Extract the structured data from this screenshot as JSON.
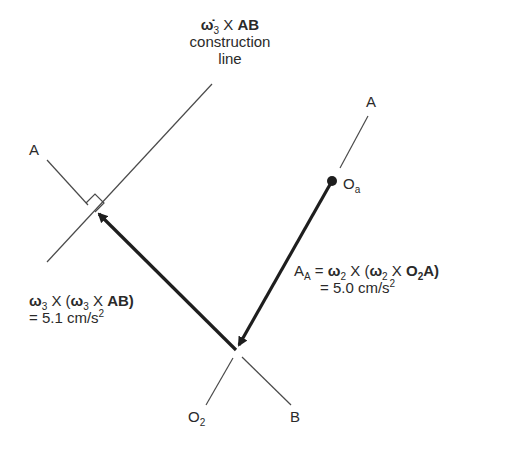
{
  "labels": {
    "construction": {
      "symbol": "ω̇",
      "sub": "3",
      "cross": "X",
      "vec": "AB",
      "line2": "construction",
      "line3": "line"
    },
    "point_a_left": "A",
    "point_a_right": "A",
    "point_oa": {
      "main": "O",
      "sub": "a"
    },
    "point_o2": {
      "main": "O",
      "sub": "2"
    },
    "point_b": "B",
    "accel_a": {
      "lhs_main": "A",
      "lhs_sub": "A",
      "eq": "=",
      "w2a": "ω",
      "w2a_sub": "2",
      "cross1": "X",
      "paren_open": "(",
      "w2b": "ω",
      "w2b_sub": "2",
      "cross2": "X",
      "o2": "O",
      "o2_sub": "2",
      "a_end": "A)",
      "value": "= 5.0 cm/s",
      "value_sup": "2"
    },
    "accel_ab": {
      "w3a": "ω",
      "w3a_sub": "3",
      "cross1": "X",
      "paren_open": "(",
      "w3b": "ω",
      "w3b_sub": "3",
      "cross2": "X",
      "ab": "AB)",
      "value": "= 5.1 cm/s",
      "value_sup": "2"
    }
  },
  "colors": {
    "ink": "#2a2a2a",
    "thin_line": "#4a4a4a",
    "background": "#ffffff"
  },
  "geometry": {
    "construction_line": [
      [
        212,
        84
      ],
      [
        47,
        262
      ]
    ],
    "ab_line_segment": [
      [
        47,
        160
      ],
      [
        88,
        205
      ]
    ],
    "arrow_ab": [
      [
        236,
        350
      ],
      [
        97,
        212
      ]
    ],
    "arrow_aa": [
      [
        332,
        181
      ],
      [
        238,
        347
      ]
    ],
    "oa_to_a_line": [
      [
        368,
        116
      ],
      [
        340,
        168
      ]
    ],
    "o2_leg": [
      [
        233,
        358
      ],
      [
        206,
        405
      ]
    ],
    "b_leg": [
      [
        242,
        357
      ],
      [
        291,
        405
      ]
    ],
    "oa_pivot": [
      332,
      181
    ]
  }
}
